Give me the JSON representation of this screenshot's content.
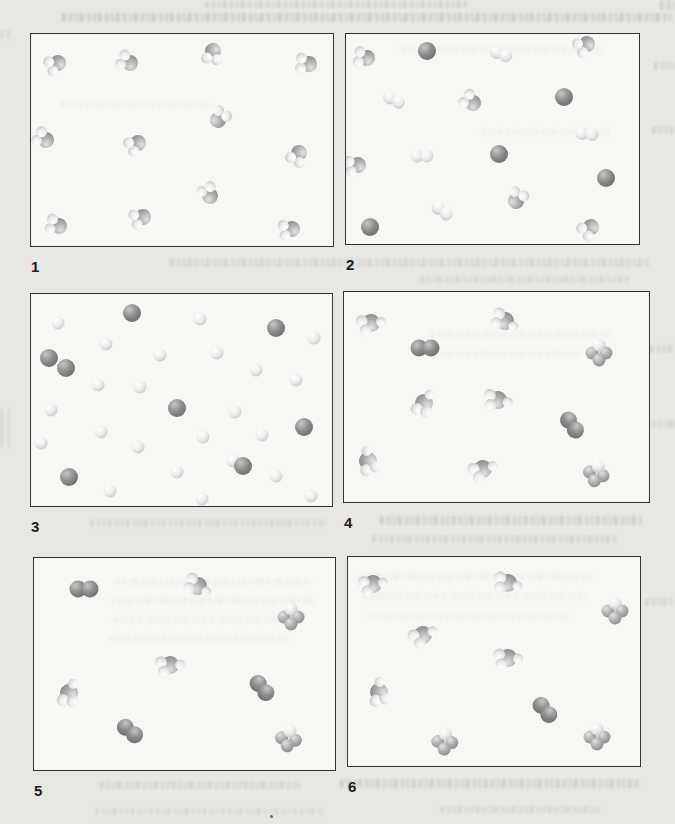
{
  "page": {
    "background": "#e8e7e4",
    "panel_background": "#f8f7f4",
    "panel_border": "#343434"
  },
  "figure": {
    "colors": {
      "dark": [
        "#c6c6c6",
        "#8b8b8b",
        "#5c5c5c"
      ],
      "mid": [
        "#e2e2e2",
        "#adadad",
        "#777777"
      ],
      "light": [
        "#ffffff",
        "#ececec",
        "#b2b2b2"
      ]
    },
    "panels": [
      {
        "label": "1",
        "molecules": [
          {
            "t": "water",
            "x": 8.9,
            "y": 13.6,
            "r": 155
          },
          {
            "t": "water",
            "x": 32.9,
            "y": 13.6,
            "r": 205
          },
          {
            "t": "water",
            "x": 60.2,
            "y": 7.9,
            "r": 100
          },
          {
            "t": "water",
            "x": 92.1,
            "y": 14.0,
            "r": 185
          },
          {
            "t": "water",
            "x": 4.9,
            "y": 50.0,
            "r": 210
          },
          {
            "t": "water",
            "x": 35.5,
            "y": 51.4,
            "r": 150
          },
          {
            "t": "water",
            "x": 61.8,
            "y": 40.7,
            "r": 305
          },
          {
            "t": "water",
            "x": 88.8,
            "y": 56.1,
            "r": 120
          },
          {
            "t": "water",
            "x": 59.2,
            "y": 76.6,
            "r": 240
          },
          {
            "t": "water",
            "x": 37.2,
            "y": 86.4,
            "r": 160
          },
          {
            "t": "water",
            "x": 9.2,
            "y": 90.7,
            "r": 195
          },
          {
            "t": "water",
            "x": 86.5,
            "y": 92.1,
            "r": 170
          }
        ]
      },
      {
        "label": "2",
        "molecules": [
          {
            "t": "water",
            "x": 7.2,
            "y": 11.2,
            "r": 190
          },
          {
            "t": "atom_dark",
            "x": 27.7,
            "y": 7.9,
            "r": 0
          },
          {
            "t": "di_light",
            "x": 52.8,
            "y": 9.3,
            "r": 20
          },
          {
            "t": "water",
            "x": 82.4,
            "y": 4.7,
            "r": 150
          },
          {
            "t": "di_light",
            "x": 16.3,
            "y": 31.3,
            "r": 25
          },
          {
            "t": "water",
            "x": 43.3,
            "y": 32.7,
            "r": 215
          },
          {
            "t": "atom_dark",
            "x": 74.3,
            "y": 29.9,
            "r": 0
          },
          {
            "t": "di_light",
            "x": 82.4,
            "y": 47.7,
            "r": 5
          },
          {
            "t": "water",
            "x": 4.2,
            "y": 62.6,
            "r": 170
          },
          {
            "t": "di_light",
            "x": 26.1,
            "y": 57.9,
            "r": 0
          },
          {
            "t": "atom_dark",
            "x": 52.1,
            "y": 57.0,
            "r": 0
          },
          {
            "t": "atom_dark",
            "x": 88.6,
            "y": 68.7,
            "r": 0
          },
          {
            "t": "di_light",
            "x": 32.6,
            "y": 84.1,
            "r": 35
          },
          {
            "t": "water",
            "x": 58.0,
            "y": 79.4,
            "r": 295
          },
          {
            "t": "atom_dark",
            "x": 8.1,
            "y": 92.1,
            "r": 0
          },
          {
            "t": "water",
            "x": 83.7,
            "y": 92.1,
            "r": 140
          }
        ]
      },
      {
        "label": "3",
        "molecules": [
          {
            "t": "atom_light",
            "x": 8.9,
            "y": 13.6
          },
          {
            "t": "atom_dark",
            "x": 33.7,
            "y": 8.9
          },
          {
            "t": "atom_light",
            "x": 56.1,
            "y": 11.7
          },
          {
            "t": "atom_dark",
            "x": 81.5,
            "y": 15.9
          },
          {
            "t": "atom_light",
            "x": 94.1,
            "y": 20.6
          },
          {
            "t": "atom_light",
            "x": 24.8,
            "y": 23.4
          },
          {
            "t": "atom_light",
            "x": 42.9,
            "y": 29.0
          },
          {
            "t": "atom_light",
            "x": 61.7,
            "y": 27.6
          },
          {
            "t": "atom_dark",
            "x": 5.9,
            "y": 30.4
          },
          {
            "t": "atom_dark",
            "x": 11.6,
            "y": 35.0
          },
          {
            "t": "atom_light",
            "x": 74.9,
            "y": 36.0
          },
          {
            "t": "atom_light",
            "x": 88.1,
            "y": 40.7
          },
          {
            "t": "atom_light",
            "x": 22.1,
            "y": 43.0
          },
          {
            "t": "atom_light",
            "x": 36.3,
            "y": 43.9
          },
          {
            "t": "atom_dark",
            "x": 48.5,
            "y": 53.7
          },
          {
            "t": "atom_light",
            "x": 6.6,
            "y": 54.7
          },
          {
            "t": "atom_light",
            "x": 67.7,
            "y": 55.6
          },
          {
            "t": "atom_dark",
            "x": 90.8,
            "y": 62.6
          },
          {
            "t": "atom_light",
            "x": 23.1,
            "y": 65.0
          },
          {
            "t": "atom_light",
            "x": 57.1,
            "y": 67.3
          },
          {
            "t": "atom_light",
            "x": 76.6,
            "y": 66.4
          },
          {
            "t": "atom_light",
            "x": 3.3,
            "y": 70.1
          },
          {
            "t": "atom_light",
            "x": 35.6,
            "y": 72.0
          },
          {
            "t": "atom_dark",
            "x": 12.5,
            "y": 86.4
          },
          {
            "t": "atom_light",
            "x": 48.5,
            "y": 84.1
          },
          {
            "t": "atom_light",
            "x": 67.0,
            "y": 79.0
          },
          {
            "t": "atom_dark",
            "x": 70.3,
            "y": 81.3
          },
          {
            "t": "atom_light",
            "x": 81.5,
            "y": 86.0
          },
          {
            "t": "atom_light",
            "x": 26.4,
            "y": 93.0
          },
          {
            "t": "atom_light",
            "x": 56.8,
            "y": 96.7
          },
          {
            "t": "atom_light",
            "x": 93.1,
            "y": 95.3
          }
        ]
      },
      {
        "label": "4",
        "molecules": [
          {
            "t": "cluster",
            "x": 8.8,
            "y": 14.6,
            "r": 210
          },
          {
            "t": "di_dark",
            "x": 26.7,
            "y": 26.9,
            "r": 0
          },
          {
            "t": "cluster",
            "x": 52.8,
            "y": 13.7,
            "r": 250
          },
          {
            "t": "trefoil",
            "x": 83.7,
            "y": 27.8,
            "r": 0
          },
          {
            "t": "cluster",
            "x": 26.1,
            "y": 52.8,
            "r": 160
          },
          {
            "t": "cluster",
            "x": 50.5,
            "y": 51.4,
            "r": 230
          },
          {
            "t": "di_dark",
            "x": 74.6,
            "y": 63.2,
            "r": 55
          },
          {
            "t": "cluster",
            "x": 7.8,
            "y": 80.7,
            "r": 120
          },
          {
            "t": "cluster",
            "x": 45.6,
            "y": 84.4,
            "r": 200
          },
          {
            "t": "trefoil",
            "x": 83.1,
            "y": 85.4,
            "r": 15
          }
        ]
      },
      {
        "label": "5",
        "molecules": [
          {
            "t": "di_dark",
            "x": 16.5,
            "y": 14.5,
            "r": 0
          },
          {
            "t": "cluster",
            "x": 54.5,
            "y": 13.1,
            "r": 250
          },
          {
            "t": "trefoil",
            "x": 85.5,
            "y": 26.2,
            "r": 0
          },
          {
            "t": "cluster",
            "x": 45.2,
            "y": 50.5,
            "r": 215
          },
          {
            "t": "cluster",
            "x": 11.6,
            "y": 63.6,
            "r": 150
          },
          {
            "t": "di_dark",
            "x": 75.9,
            "y": 61.2,
            "r": 50
          },
          {
            "t": "di_dark",
            "x": 32.0,
            "y": 81.8,
            "r": 40
          },
          {
            "t": "trefoil",
            "x": 84.8,
            "y": 84.1,
            "r": 10
          }
        ]
      },
      {
        "label": "6",
        "molecules": [
          {
            "t": "cluster",
            "x": 8.5,
            "y": 12.8,
            "r": 210
          },
          {
            "t": "cluster",
            "x": 54.8,
            "y": 12.3,
            "r": 235
          },
          {
            "t": "trefoil",
            "x": 91.5,
            "y": 24.6,
            "r": 0
          },
          {
            "t": "cluster",
            "x": 25.8,
            "y": 37.4,
            "r": 195
          },
          {
            "t": "cluster",
            "x": 54.8,
            "y": 48.3,
            "r": 220
          },
          {
            "t": "cluster",
            "x": 10.5,
            "y": 64.5,
            "r": 130
          },
          {
            "t": "di_dark",
            "x": 67.3,
            "y": 73.0,
            "r": 50
          },
          {
            "t": "trefoil",
            "x": 33.3,
            "y": 87.2,
            "r": 5
          },
          {
            "t": "trefoil",
            "x": 85.4,
            "y": 84.8,
            "r": 0
          }
        ]
      }
    ]
  }
}
